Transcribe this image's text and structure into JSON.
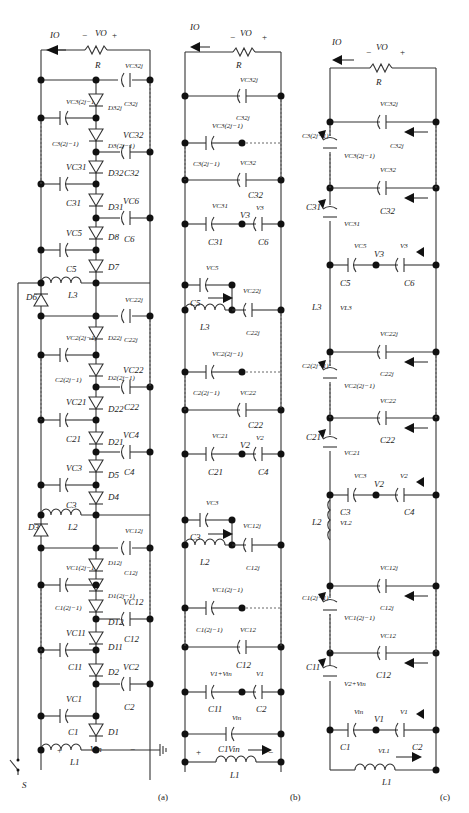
{
  "figure": {
    "panels": [
      {
        "id": "a",
        "label": "(a)"
      },
      {
        "id": "b",
        "label": "(b)"
      },
      {
        "id": "c",
        "label": "(c)"
      }
    ]
  },
  "panel_a": {
    "input": {
      "plus": "+",
      "minus": "−",
      "vin": "Vin",
      "switch": "S"
    },
    "inductors": {
      "L1": "L1",
      "L2": "L2",
      "L3": "L3"
    },
    "diodes": {
      "D1": "D1",
      "D2": "D2",
      "D3": "D3",
      "D4": "D4",
      "D5": "D5",
      "D6": "D6",
      "D7": "D7",
      "D8": "D8",
      "D11": "D11",
      "D12": "D12",
      "D12j1": "D1(2j−1)",
      "D12j": "D12j",
      "D21": "D21",
      "D22": "D22",
      "D22j1": "D2(2j−1)",
      "D22j": "D22j",
      "D31": "D31",
      "D32": "D32",
      "D32j1": "D3(2j−1)",
      "D32j": "D32j"
    },
    "capacitors": {
      "C1": "C1",
      "C2": "C2",
      "C3": "C3",
      "C4": "C4",
      "C5": "C5",
      "C6": "C6",
      "C11": "C11",
      "C12": "C12",
      "C12j1": "C1(2j−1)",
      "C12j": "C12j",
      "C21": "C21",
      "C22": "C22",
      "C22j1": "C2(2j−1)",
      "C22j": "C22j",
      "C31": "C31",
      "C32": "C32",
      "C32j1": "C3(2j−1)",
      "C32j": "C32j"
    },
    "voltages": {
      "VC1": "VC1",
      "VC2": "VC2",
      "VC3": "VC3",
      "VC4": "VC4",
      "VC5": "VC5",
      "VC6": "VC6",
      "VC11": "VC11",
      "VC12": "VC12",
      "VC12j1": "VC1(2j−1)",
      "VC12j": "VC12j",
      "VC21": "VC21",
      "VC22": "VC22",
      "VC22j1": "VC2(2j−1)",
      "VC22j": "VC22j",
      "VC31": "VC31",
      "VC32": "VC32",
      "VC32j1": "VC3(2j−1)",
      "VC32j": "VC32j"
    },
    "load": {
      "R": "R",
      "VO": "VO",
      "IO": "IO",
      "plus": "+",
      "minus": "−"
    }
  },
  "panel_b": {
    "input": {
      "plus": "+",
      "minus": "−",
      "vin": "Vin"
    },
    "nodes": {
      "V1": "V1",
      "V2": "V2",
      "V3": "V3"
    },
    "labels": {
      "L1": "L1",
      "L2": "L2",
      "L3": "L3",
      "C1": "C1",
      "C2": "C2",
      "C3": "C3",
      "C4": "C4",
      "C5": "C5",
      "C6": "C6",
      "C11": "C11",
      "C12": "C12",
      "C12j1": "C1(2j−1)",
      "C12j": "C12j",
      "C21": "C21",
      "C22": "C22",
      "C22j1": "C2(2j−1)",
      "C22j": "C22j",
      "C31": "C31",
      "C32": "C32",
      "C32j1": "C3(2j−1)",
      "C32j": "C32j",
      "VC1": "Vin",
      "VC2": "V1",
      "VC11": "V1+Vin",
      "VC3": "VC3",
      "VC4": "V2",
      "VC21": "VC21",
      "VC5": "VC5",
      "VC6": "V3",
      "VC31": "VC31",
      "VC12": "VC12",
      "VC12j1": "VC1(2j−1)",
      "VC12j": "VC12j",
      "VC22": "VC22",
      "VC22j1": "VC2(2j−1)",
      "VC22j": "VC22j",
      "VC32": "VC32",
      "VC32j1": "VC3(2j−1)",
      "VC32j": "VC32j"
    },
    "load": {
      "R": "R",
      "VO": "VO",
      "IO": "IO",
      "plus": "+",
      "minus": "−"
    }
  },
  "panel_c": {
    "labels": {
      "L1": "L1",
      "L2": "L2",
      "L3": "L3",
      "VL1": "VL1",
      "VL2": "VL2",
      "VL3": "VL3",
      "C1": "C1",
      "C2": "C2",
      "C3": "C3",
      "C4": "C4",
      "C5": "C5",
      "C6": "C6",
      "C11": "C11",
      "C12": "C12",
      "C12j1": "C1(2j−1)",
      "C12j": "C12j",
      "C21": "C21",
      "C22": "C22",
      "C22j1": "C2(2j−1)",
      "C22j": "C22j",
      "C31": "C31",
      "C32": "C32",
      "C32j1": "C3(2j−1)",
      "C32j": "C32j",
      "VC1": "Vin",
      "V1": "V1",
      "VC2": "V1",
      "VC11": "V2+Vin",
      "VC3": "VC3",
      "V2": "V2",
      "VC4": "V2",
      "VC21": "VC21",
      "VC5": "VC5",
      "V3": "V3",
      "VC6": "V3",
      "VC31": "VC31",
      "VC12": "VC12",
      "VC12j1": "VC1(2j−1)",
      "VC12j": "VC12j",
      "VC22": "VC22",
      "VC22j1": "VC2(2j−1)",
      "VC22j": "VC22j",
      "VC32": "VC32",
      "VC32j1": "VC3(2j−1)",
      "VC32j": "VC32j"
    },
    "load": {
      "R": "R",
      "VO": "VO",
      "IO": "IO",
      "plus": "+",
      "minus": "−"
    }
  }
}
